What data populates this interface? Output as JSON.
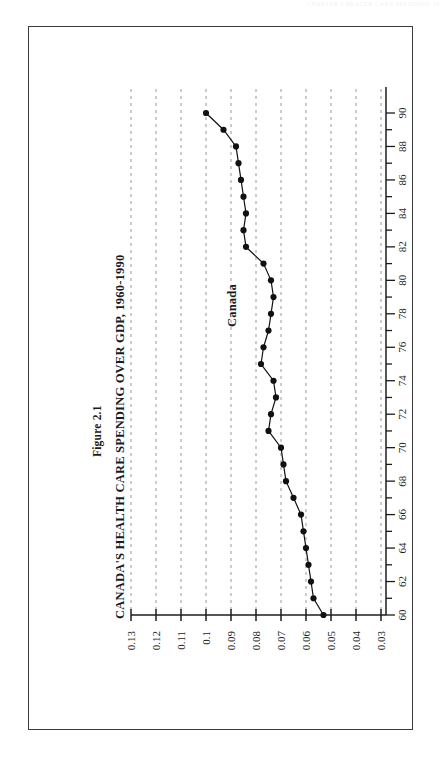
{
  "page": {
    "header_text": "CHAPTER 2  HEALTH CARE SPENDING",
    "page_number": "19"
  },
  "figure": {
    "label": "Figure 2.1",
    "title": "CANADA'S HEALTH CARE SPENDING OVER GDP, 1960-1990",
    "series_annotation": "Canada"
  },
  "chart_data": {
    "type": "line",
    "title": "CANADA'S HEALTH CARE SPENDING OVER GDP, 1960-1990",
    "subtitle": "Figure 2.1",
    "orientation": "rotated-90",
    "xlabel": "",
    "ylabel": "",
    "xlim": [
      1960,
      1990
    ],
    "ylim": [
      0.03,
      0.13
    ],
    "grid": "dashed-value-gridlines",
    "legend": "inline-annotation",
    "annotations": [
      {
        "text": "Canada",
        "x": 1984,
        "y": 0.094
      }
    ],
    "x_tick_labels": [
      "60",
      "62",
      "64",
      "66",
      "68",
      "70",
      "72",
      "74",
      "76",
      "78",
      "80",
      "82",
      "84",
      "86",
      "88",
      "90"
    ],
    "x_tick_values": [
      1960,
      1962,
      1964,
      1966,
      1968,
      1970,
      1972,
      1974,
      1976,
      1978,
      1980,
      1982,
      1984,
      1986,
      1988,
      1990
    ],
    "x_minor_ticks_every": 1,
    "y_tick_labels": [
      "0.13",
      "0.12",
      "0.11",
      "0.1",
      "0.09",
      "0.08",
      "0.07",
      "0.06",
      "0.05",
      "0.04",
      "0.03"
    ],
    "y_tick_values": [
      0.13,
      0.12,
      0.11,
      0.1,
      0.09,
      0.08,
      0.07,
      0.06,
      0.05,
      0.04,
      0.03
    ],
    "series": [
      {
        "name": "Canada",
        "marker": "filled-circle",
        "color": "#111111",
        "x": [
          1960,
          1961,
          1962,
          1963,
          1964,
          1965,
          1966,
          1967,
          1968,
          1969,
          1970,
          1971,
          1972,
          1973,
          1974,
          1975,
          1976,
          1977,
          1978,
          1979,
          1980,
          1981,
          1982,
          1983,
          1984,
          1985,
          1986,
          1987,
          1988,
          1989,
          1990
        ],
        "values": [
          0.053,
          0.057,
          0.058,
          0.059,
          0.06,
          0.061,
          0.062,
          0.065,
          0.068,
          0.069,
          0.07,
          0.075,
          0.074,
          0.072,
          0.073,
          0.078,
          0.077,
          0.075,
          0.074,
          0.073,
          0.074,
          0.077,
          0.084,
          0.085,
          0.084,
          0.085,
          0.086,
          0.087,
          0.088,
          0.093,
          0.1
        ]
      }
    ]
  }
}
